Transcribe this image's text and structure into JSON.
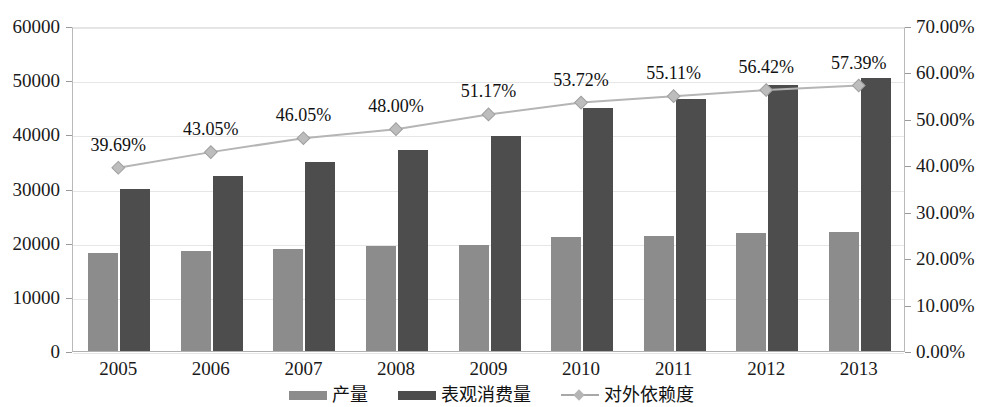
{
  "chart_data": {
    "type": "bar",
    "title": "",
    "subtitle": "",
    "xlabel": "",
    "ylabel": "",
    "y2label": "",
    "categories": [
      "2005",
      "2006",
      "2007",
      "2008",
      "2009",
      "2010",
      "2011",
      "2012",
      "2013"
    ],
    "ylim": [
      0,
      60000
    ],
    "yticks": [
      "0",
      "10000",
      "20000",
      "30000",
      "40000",
      "50000",
      "60000"
    ],
    "ytick_values": [
      0,
      10000,
      20000,
      30000,
      40000,
      50000,
      60000
    ],
    "y2lim": [
      0,
      70
    ],
    "y2ticks": [
      "0.00%",
      "10.00%",
      "20.00%",
      "30.00%",
      "40.00%",
      "50.00%",
      "60.00%",
      "70.00%"
    ],
    "y2tick_values": [
      0,
      10,
      20,
      30,
      40,
      50,
      60,
      70
    ],
    "grid": true,
    "legend_position": "bottom",
    "series": [
      {
        "name": "产量",
        "type": "bar",
        "axis": "left",
        "color": "#8c8c8c",
        "values": [
          18100,
          18500,
          18900,
          19300,
          19600,
          21000,
          21200,
          21700,
          21900
        ]
      },
      {
        "name": "表观消费量",
        "type": "bar",
        "axis": "left",
        "color": "#4d4d4d",
        "values": [
          30000,
          32300,
          34900,
          37100,
          39700,
          44900,
          46500,
          49100,
          50400
        ]
      },
      {
        "name": "对外依赖度",
        "type": "line",
        "axis": "right",
        "color": "#b5b5b5",
        "values": [
          39.69,
          43.05,
          46.05,
          48.0,
          51.17,
          53.72,
          55.11,
          56.42,
          57.39
        ],
        "data_labels": [
          "39.69%",
          "43.05%",
          "46.05%",
          "48.00%",
          "51.17%",
          "53.72%",
          "55.11%",
          "56.42%",
          "57.39%"
        ]
      }
    ]
  }
}
